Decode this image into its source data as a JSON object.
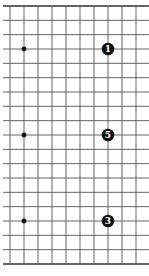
{
  "diagram": {
    "type": "go-board-fragment",
    "rows": 19,
    "visible_columns": 10,
    "colors": {
      "line": "#555555",
      "edge": "#333333",
      "stone": "#111111",
      "label": "#ffffff",
      "background": "#ffffff"
    },
    "star_points": [
      {
        "col": 1,
        "row": 3
      },
      {
        "col": 1,
        "row": 9
      },
      {
        "col": 1,
        "row": 15
      }
    ],
    "stones": [
      {
        "col": 7,
        "row": 3,
        "color": "black",
        "label": "1"
      },
      {
        "col": 7,
        "row": 9,
        "color": "black",
        "label": "5"
      },
      {
        "col": 7,
        "row": 15,
        "color": "black",
        "label": "3"
      }
    ]
  }
}
